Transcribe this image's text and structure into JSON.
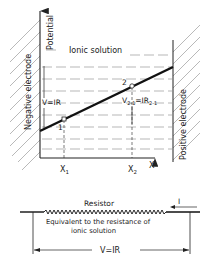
{
  "diagram": {
    "y_axis_label": "Potential",
    "x_axis_label": "X",
    "region_label": "Ionic solution",
    "left_electrode_label": "Negative electrode",
    "right_electrode_label": "Positive electrode",
    "voltage_label": "V=IR",
    "segment_label_main": "V",
    "segment_label_sub": "2-1",
    "segment_label_eq": "=IR",
    "segment_label_sub2": "2-1",
    "point_1": "1",
    "point_2": "2",
    "x1_main": "X",
    "x1_sub": "1",
    "x2_main": "X",
    "x2_sub": "2"
  },
  "circuit": {
    "resistor_label": "Resistor",
    "current_label": "I",
    "equivalent_line1": "Equivalent to the resistance of",
    "equivalent_line2": "ionic solution",
    "voltage_label": "V=IR"
  },
  "colors": {
    "ink": "#222222",
    "dash": "#9a9a9a",
    "hatch": "#8a8a8a"
  }
}
